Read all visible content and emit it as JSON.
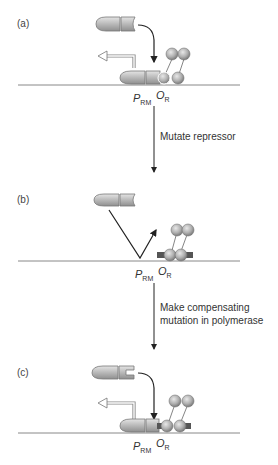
{
  "panels": [
    {
      "id": "a",
      "label": "(a)",
      "promoter_label": "P",
      "promoter_sub": "RM",
      "operator_label": "O",
      "operator_sub": "R"
    },
    {
      "id": "b",
      "label": "(b)",
      "promoter_label": "P",
      "promoter_sub": "RM",
      "operator_label": "O",
      "operator_sub": "R"
    },
    {
      "id": "c",
      "label": "(c)",
      "promoter_label": "P",
      "promoter_sub": "RM",
      "operator_label": "O",
      "operator_sub": "R"
    }
  ],
  "steps": [
    {
      "label_lines": [
        "Mutate repressor"
      ]
    },
    {
      "label_lines": [
        "Make compensating",
        "mutation in polymerase"
      ]
    }
  ],
  "colors": {
    "protein_fill": "#b8b8b8",
    "protein_stroke": "#6a6a6a",
    "dna_line": "#888888",
    "arrow": "#222222",
    "mutation_mark": "#555555"
  }
}
